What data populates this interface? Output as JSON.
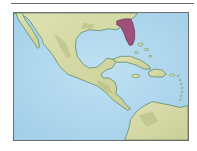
{
  "map": {
    "region": "Gulf of Mexico and Caribbean",
    "highlighted_region": "Florida",
    "colors": {
      "ocean": "#a9d3ec",
      "ocean_shallow": "#c6e3f3",
      "land": "#d9dcaa",
      "land_shadow": "#b7bd86",
      "coast": "#5e8a6a",
      "highlight": "#a2507a",
      "frame": "#6e6e6e"
    }
  }
}
